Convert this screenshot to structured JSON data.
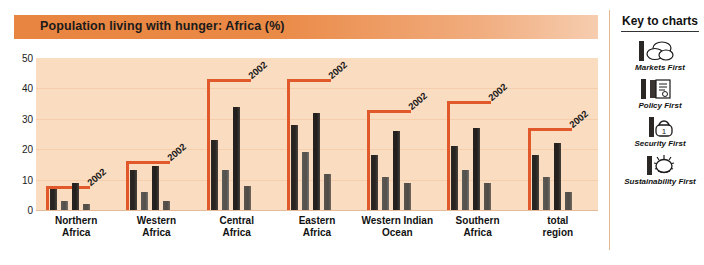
{
  "title": "Population living with hunger: Africa (%)",
  "key_panel": {
    "heading": "Key to charts",
    "items": [
      {
        "label": "Markets First",
        "icon": "coins-icon"
      },
      {
        "label": "Policy First",
        "icon": "document-icon"
      },
      {
        "label": "Security First",
        "icon": "padlock-icon"
      },
      {
        "label": "Sustainability First",
        "icon": "sun-icon"
      }
    ]
  },
  "chart_data": {
    "type": "bar",
    "title": "Population living with hunger: Africa (%)",
    "xlabel": "",
    "ylabel": "",
    "ylim": [
      0,
      50
    ],
    "yticks": [
      0,
      10,
      20,
      30,
      40,
      50
    ],
    "grid": true,
    "legend_position": "right",
    "categories": [
      "Northern Africa",
      "Western Africa",
      "Central Africa",
      "Eastern Africa",
      "Western Indian Ocean",
      "Southern Africa",
      "total region"
    ],
    "series": [
      {
        "name": "Markets First",
        "values": [
          7,
          13,
          23,
          28,
          18,
          21,
          18
        ]
      },
      {
        "name": "Policy First",
        "values": [
          3,
          6,
          13,
          19,
          11,
          13,
          11
        ]
      },
      {
        "name": "Security First",
        "values": [
          9,
          14.5,
          34,
          32,
          26,
          27,
          22
        ]
      },
      {
        "name": "Sustainability First",
        "values": [
          2,
          3,
          8,
          12,
          9,
          9,
          6
        ]
      }
    ],
    "reference_series": {
      "name": "2002",
      "label": "2002",
      "color": "#e1582a",
      "values": [
        8,
        16,
        43,
        43,
        33,
        36,
        27
      ]
    }
  }
}
